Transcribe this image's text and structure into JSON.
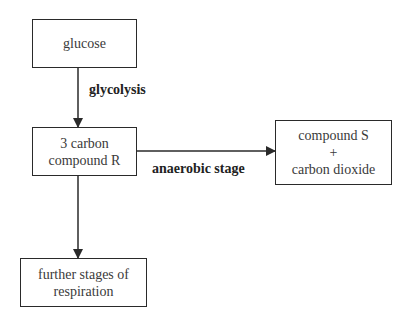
{
  "diagram": {
    "type": "flowchart",
    "nodes": {
      "glucose": {
        "lines": [
          "glucose"
        ]
      },
      "compound_r": {
        "lines": [
          "3 carbon",
          "compound R"
        ]
      },
      "compound_s": {
        "lines": [
          "compound S",
          "+",
          "carbon dioxide"
        ]
      },
      "further": {
        "lines": [
          "further stages of",
          "respiration"
        ]
      }
    },
    "edges": {
      "glycolysis": {
        "from": "glucose",
        "to": "compound_r",
        "label": "glycolysis"
      },
      "anaerobic": {
        "from": "compound_r",
        "to": "compound_s",
        "label": "anaerobic stage"
      },
      "further": {
        "from": "compound_r",
        "to": "further",
        "label": ""
      }
    },
    "colors": {
      "line": "#2a2a2a",
      "text": "#333333",
      "background": "#ffffff"
    }
  }
}
